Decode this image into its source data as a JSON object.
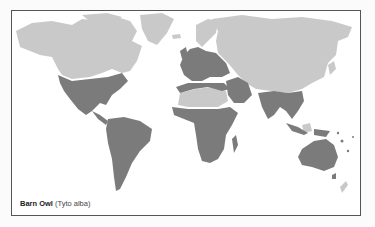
{
  "map": {
    "caption": {
      "common_name": "Barn Owl",
      "scientific_name": "(Tyto alba)"
    },
    "legend": {
      "range_color": "#7b7b7b",
      "non_range_land_color": "#c9c9c9",
      "ocean_color": "#ffffff"
    },
    "regions_in_range": [
      "North America (USA, Mexico)",
      "Central America",
      "South America",
      "Europe",
      "North Africa coast",
      "Sub-Saharan Africa",
      "Middle East",
      "Indian subcontinent",
      "Southeast Asia",
      "Australia",
      "New Guinea",
      "Pacific islands"
    ],
    "regions_out_of_range": [
      "Canada",
      "Alaska",
      "Greenland",
      "Scandinavia",
      "Russia",
      "Central Asia",
      "China",
      "Sahara",
      "Amazon basin",
      "Central African rainforest",
      "New Zealand"
    ]
  }
}
